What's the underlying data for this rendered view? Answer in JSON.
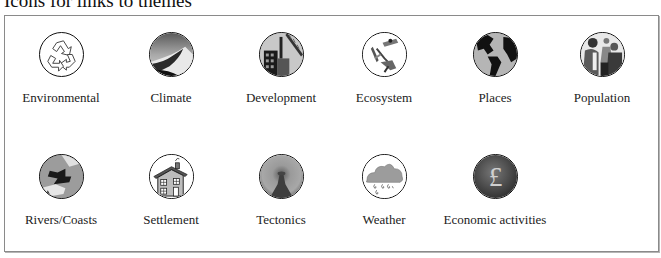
{
  "page": {
    "title": "Icons for links to themes"
  },
  "themes": [
    {
      "label": "Environmental",
      "icon": "recycle-icon"
    },
    {
      "label": "Climate",
      "icon": "desert-dune-icon"
    },
    {
      "label": "Development",
      "icon": "construction-crane-icon"
    },
    {
      "label": "Ecosystem",
      "icon": "insects-icon"
    },
    {
      "label": "Places",
      "icon": "globe-icon"
    },
    {
      "label": "Population",
      "icon": "people-icon"
    },
    {
      "label": "Rivers/Coasts",
      "icon": "river-icon"
    },
    {
      "label": "Settlement",
      "icon": "house-icon"
    },
    {
      "label": "Tectonics",
      "icon": "volcano-icon"
    },
    {
      "label": "Weather",
      "icon": "rain-cloud-icon"
    },
    {
      "label": "Economic activities",
      "icon": "pound-sign-icon"
    }
  ],
  "colors": {
    "frame_border": "#8a8a8a",
    "icon_outline": "#111111",
    "text": "#222222"
  }
}
